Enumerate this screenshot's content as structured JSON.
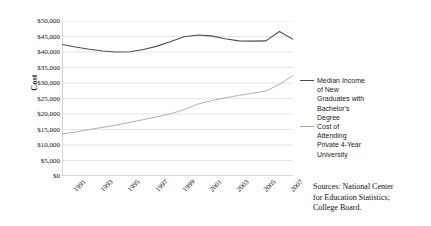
{
  "chart_data": {
    "type": "line",
    "title": "",
    "xlabel": "",
    "ylabel": "Cost",
    "ylim": [
      0,
      50000
    ],
    "ytick_step": 5000,
    "ytick_labels": [
      "$50,000",
      "$45,000",
      "$40,000",
      "$35,000",
      "$30,000",
      "$25,000",
      "$20,000",
      "$15,000",
      "$10,000",
      "$5,000",
      "$0"
    ],
    "ytick_values": [
      50000,
      45000,
      40000,
      35000,
      30000,
      25000,
      20000,
      15000,
      10000,
      5000,
      0
    ],
    "xtick_labels": [
      "1991",
      "1993",
      "1995",
      "1997",
      "1999",
      "2001",
      "2003",
      "2005",
      "2007"
    ],
    "x": [
      1991,
      1992,
      1993,
      1994,
      1995,
      1996,
      1997,
      1998,
      1999,
      2000,
      2001,
      2002,
      2003,
      2004,
      2005,
      2006,
      2007,
      2008
    ],
    "xlim": [
      1991,
      2008
    ],
    "grid": "horizontal",
    "legend_position": "right",
    "series": [
      {
        "name": "Median Income of New Graduates with Bachelor's Degree",
        "color": "#4d4d4d",
        "values": [
          42400,
          41600,
          40900,
          40300,
          40000,
          40100,
          40800,
          41900,
          43400,
          44900,
          45500,
          45200,
          44300,
          43600,
          43500,
          43600,
          46600,
          44100
        ]
      },
      {
        "name": "Cost of Attending Private 4-Year University",
        "color": "#a6a6a6",
        "values": [
          13600,
          14200,
          15000,
          15700,
          16400,
          17300,
          18200,
          19100,
          20100,
          21400,
          23200,
          24300,
          25200,
          26000,
          26700,
          27400,
          29600,
          32400
        ]
      }
    ]
  },
  "axis": {
    "y_title": "Cost"
  },
  "legend": {
    "entries": [
      {
        "label": "Median Income\nof New\nGraduates with\nBachelor's\nDegree",
        "color": "#4d4d4d"
      },
      {
        "label": "Cost of\nAttending\nPrivate 4-Year\nUniversity",
        "color": "#a6a6a6"
      }
    ]
  },
  "source": {
    "text": "Sources: National Center\nfor Education Statistics;\nCollege Board."
  }
}
